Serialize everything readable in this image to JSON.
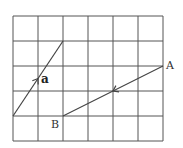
{
  "diagram": {
    "grid": {
      "origin_x": 13,
      "origin_y": 16,
      "cell": 25,
      "cols": 6,
      "rows": 5,
      "line_color": "#555555"
    },
    "vectors": [
      {
        "name": "a",
        "label": "a",
        "from": [
          0,
          4
        ],
        "to": [
          2,
          1
        ],
        "arrow_direction": "up",
        "label_bold": true
      },
      {
        "name": "AB",
        "label": "",
        "from": [
          6,
          2
        ],
        "to": [
          2,
          4
        ],
        "arrow_direction": "toward B"
      }
    ],
    "points": [
      {
        "name": "A",
        "label": "A",
        "grid": [
          6,
          2
        ]
      },
      {
        "name": "B",
        "label": "B",
        "grid": [
          2,
          4
        ]
      }
    ],
    "labels": {
      "a": "a",
      "A": "A",
      "B": "B"
    }
  }
}
